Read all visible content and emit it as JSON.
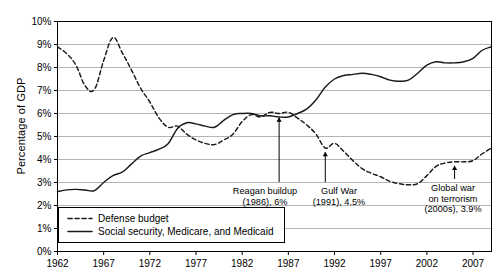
{
  "chart_data": {
    "type": "line",
    "title": "",
    "xlabel": "",
    "ylabel": "Percentage of GDP",
    "xlim": [
      1962,
      2009
    ],
    "ylim": [
      0,
      10
    ],
    "grid": true,
    "legend_position": "bottom-left",
    "y_ticks": [
      "0%",
      "1%",
      "2%",
      "3%",
      "4%",
      "5%",
      "6%",
      "7%",
      "8%",
      "9%",
      "10%"
    ],
    "y_tick_values": [
      0,
      1,
      2,
      3,
      4,
      5,
      6,
      7,
      8,
      9,
      10
    ],
    "x_ticks": [
      "1962",
      "1967",
      "1972",
      "1977",
      "1982",
      "1987",
      "1992",
      "1997",
      "2002",
      "2007"
    ],
    "x_tick_values": [
      1962,
      1967,
      1972,
      1977,
      1982,
      1987,
      1992,
      1997,
      2002,
      2007
    ],
    "x": [
      1962,
      1963,
      1964,
      1965,
      1966,
      1967,
      1968,
      1969,
      1970,
      1971,
      1972,
      1973,
      1974,
      1975,
      1976,
      1977,
      1978,
      1979,
      1980,
      1981,
      1982,
      1983,
      1984,
      1985,
      1986,
      1987,
      1988,
      1989,
      1990,
      1991,
      1992,
      1993,
      1994,
      1995,
      1996,
      1997,
      1998,
      1999,
      2000,
      2001,
      2002,
      2003,
      2004,
      2005,
      2006,
      2007,
      2008,
      2009
    ],
    "series": [
      {
        "name": "Defense budget",
        "style": "dashed",
        "color": "#1a1a1a",
        "values": [
          8.9,
          8.6,
          8.1,
          7.2,
          7.05,
          8.3,
          9.3,
          8.65,
          7.9,
          7.1,
          6.5,
          5.8,
          5.4,
          5.45,
          5.1,
          4.85,
          4.7,
          4.65,
          4.85,
          5.1,
          5.65,
          5.95,
          5.85,
          6.05,
          6.0,
          6.05,
          5.8,
          5.5,
          5.1,
          4.5,
          4.7,
          4.35,
          3.95,
          3.6,
          3.4,
          3.25,
          3.05,
          2.95,
          2.9,
          2.95,
          3.3,
          3.7,
          3.85,
          3.9,
          3.9,
          3.95,
          4.25,
          4.5
        ]
      },
      {
        "name": "Social security, Medicare, and Medicaid",
        "style": "solid",
        "color": "#1a1a1a",
        "values": [
          2.6,
          2.68,
          2.7,
          2.67,
          2.65,
          3.0,
          3.3,
          3.45,
          3.8,
          4.15,
          4.3,
          4.45,
          4.7,
          5.35,
          5.6,
          5.55,
          5.45,
          5.4,
          5.7,
          5.95,
          6.0,
          6.0,
          5.9,
          5.9,
          5.85,
          5.85,
          6.0,
          6.2,
          6.6,
          7.15,
          7.5,
          7.65,
          7.7,
          7.75,
          7.7,
          7.6,
          7.45,
          7.4,
          7.45,
          7.75,
          8.1,
          8.25,
          8.2,
          8.2,
          8.25,
          8.4,
          8.75,
          8.9
        ]
      }
    ],
    "annotations": [
      {
        "id": "reagan-buildup",
        "lines": [
          "Reagan buildup",
          "(1986), 6%"
        ],
        "point_year": 1986,
        "point_value": 6.0,
        "label": "Reagan buildup (1986), 6%"
      },
      {
        "id": "gulf-war",
        "lines": [
          "Gulf War",
          "(1991), 4.5%"
        ],
        "point_year": 1991,
        "point_value": 4.5,
        "label": "Gulf War (1991), 4.5%"
      },
      {
        "id": "global-war-on-terrorism",
        "lines": [
          "Global war",
          "on terrorism",
          "(2000s), 3.9%"
        ],
        "point_year": 2005,
        "point_value": 3.9,
        "label": "Global war on terrorism (2000s), 3.9%"
      }
    ],
    "legend": [
      {
        "label": "Defense budget",
        "style": "dashed"
      },
      {
        "label": "Social security, Medicare, and Medicaid",
        "style": "solid"
      }
    ],
    "colors": {
      "line": "#1a1a1a",
      "grid": "#b4b4b4",
      "axis": "#000000",
      "background": "#ffffff"
    }
  }
}
